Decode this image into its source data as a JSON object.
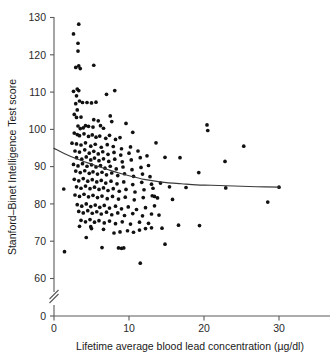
{
  "chart_data": {
    "type": "scatter",
    "title": "",
    "xlabel": "Lifetime average blood lead concentration (µg/dl)",
    "ylabel": "Stanford–Binet Intelligence Test score",
    "xlim": [
      0,
      34
    ],
    "ylim": [
      57,
      131
    ],
    "y_axis_break": {
      "present": true,
      "between": [
        0,
        57
      ],
      "zero_tick": 0
    },
    "grid": false,
    "legend": null,
    "xticks": [
      0,
      10,
      20,
      30
    ],
    "yticks": [
      0,
      60,
      70,
      80,
      90,
      100,
      110,
      120,
      130
    ],
    "marker": {
      "shape": "circle",
      "color": "#111111",
      "size_px": 2.6
    },
    "series": [
      {
        "name": "Children",
        "points": [
          [
            1.3,
            84.0
          ],
          [
            1.4,
            67.2
          ],
          [
            3.3,
            128.2
          ],
          [
            2.6,
            125.6
          ],
          [
            3.2,
            123.1
          ],
          [
            3.2,
            121.0
          ],
          [
            3.3,
            117.0
          ],
          [
            3.5,
            116.3
          ],
          [
            2.9,
            116.6
          ],
          [
            5.3,
            117.2
          ],
          [
            3.1,
            110.8
          ],
          [
            3.3,
            110.4
          ],
          [
            2.6,
            110.2
          ],
          [
            3.0,
            109.0
          ],
          [
            7.0,
            109.4
          ],
          [
            8.1,
            110.4
          ],
          [
            3.4,
            107.6
          ],
          [
            3.8,
            107.2
          ],
          [
            2.9,
            106.9
          ],
          [
            4.4,
            107.2
          ],
          [
            5.0,
            107.1
          ],
          [
            5.6,
            107.3
          ],
          [
            3.1,
            105.2
          ],
          [
            2.7,
            104.0
          ],
          [
            3.0,
            103.2
          ],
          [
            3.6,
            103.3
          ],
          [
            7.5,
            103.6
          ],
          [
            7.7,
            102.1
          ],
          [
            5.3,
            102.6
          ],
          [
            5.9,
            102.3
          ],
          [
            4.2,
            101.0
          ],
          [
            4.6,
            100.8
          ],
          [
            5.2,
            100.6
          ],
          [
            3.2,
            100.9
          ],
          [
            3.5,
            100.2
          ],
          [
            3.9,
            100.4
          ],
          [
            6.2,
            101.0
          ],
          [
            6.6,
            100.3
          ],
          [
            9.6,
            101.6
          ],
          [
            10.5,
            99.2
          ],
          [
            20.4,
            101.2
          ],
          [
            20.5,
            99.7
          ],
          [
            2.7,
            99.0
          ],
          [
            3.1,
            98.6
          ],
          [
            3.4,
            98.3
          ],
          [
            4.0,
            98.8
          ],
          [
            4.6,
            98.1
          ],
          [
            5.1,
            98.5
          ],
          [
            5.6,
            97.9
          ],
          [
            6.1,
            98.2
          ],
          [
            6.9,
            97.6
          ],
          [
            7.4,
            98.4
          ],
          [
            8.2,
            97.3
          ],
          [
            8.8,
            97.8
          ],
          [
            2.4,
            96.3
          ],
          [
            3.0,
            96.1
          ],
          [
            3.6,
            95.8
          ],
          [
            4.2,
            96.4
          ],
          [
            4.9,
            95.5
          ],
          [
            5.5,
            96.0
          ],
          [
            6.3,
            95.2
          ],
          [
            7.1,
            95.9
          ],
          [
            7.9,
            95.4
          ],
          [
            9.0,
            94.8
          ],
          [
            10.2,
            95.3
          ],
          [
            13.6,
            96.4
          ],
          [
            25.3,
            95.5
          ],
          [
            2.8,
            94.2
          ],
          [
            3.4,
            93.9
          ],
          [
            4.1,
            94.5
          ],
          [
            4.7,
            93.6
          ],
          [
            5.3,
            94.1
          ],
          [
            5.9,
            93.4
          ],
          [
            6.5,
            94.0
          ],
          [
            7.2,
            93.3
          ],
          [
            8.0,
            93.8
          ],
          [
            8.9,
            93.1
          ],
          [
            10.0,
            93.6
          ],
          [
            11.2,
            94.2
          ],
          [
            3.0,
            92.4
          ],
          [
            3.7,
            92.0
          ],
          [
            4.3,
            92.6
          ],
          [
            4.9,
            91.8
          ],
          [
            5.4,
            92.3
          ],
          [
            6.0,
            91.6
          ],
          [
            6.6,
            92.1
          ],
          [
            7.3,
            91.4
          ],
          [
            8.1,
            92.0
          ],
          [
            9.1,
            91.3
          ],
          [
            10.3,
            91.8
          ],
          [
            11.5,
            92.4
          ],
          [
            12.4,
            92.9
          ],
          [
            14.8,
            92.5
          ],
          [
            16.8,
            92.4
          ],
          [
            22.8,
            91.4
          ],
          [
            2.6,
            90.6
          ],
          [
            3.2,
            90.2
          ],
          [
            3.8,
            90.8
          ],
          [
            4.4,
            90.1
          ],
          [
            5.0,
            90.5
          ],
          [
            5.6,
            89.9
          ],
          [
            6.2,
            90.3
          ],
          [
            6.8,
            89.6
          ],
          [
            7.5,
            90.1
          ],
          [
            8.3,
            89.4
          ],
          [
            9.2,
            89.9
          ],
          [
            10.4,
            89.2
          ],
          [
            11.6,
            89.8
          ],
          [
            12.6,
            90.3
          ],
          [
            19.3,
            88.4
          ],
          [
            2.9,
            88.8
          ],
          [
            3.5,
            88.4
          ],
          [
            4.1,
            88.9
          ],
          [
            4.7,
            88.2
          ],
          [
            5.2,
            88.6
          ],
          [
            5.8,
            88.0
          ],
          [
            6.4,
            88.5
          ],
          [
            7.0,
            87.8
          ],
          [
            7.7,
            88.3
          ],
          [
            8.5,
            87.6
          ],
          [
            9.4,
            88.1
          ],
          [
            10.6,
            87.4
          ],
          [
            11.8,
            88.0
          ],
          [
            12.8,
            87.3
          ],
          [
            2.7,
            86.6
          ],
          [
            3.3,
            86.2
          ],
          [
            3.9,
            86.8
          ],
          [
            4.5,
            86.1
          ],
          [
            5.1,
            86.5
          ],
          [
            5.7,
            85.9
          ],
          [
            6.3,
            86.3
          ],
          [
            6.9,
            85.6
          ],
          [
            7.6,
            86.1
          ],
          [
            8.4,
            85.4
          ],
          [
            9.3,
            85.9
          ],
          [
            10.5,
            85.2
          ],
          [
            11.7,
            85.8
          ],
          [
            13.0,
            85.3
          ],
          [
            14.2,
            85.6
          ],
          [
            3.0,
            84.6
          ],
          [
            3.6,
            84.2
          ],
          [
            4.2,
            84.8
          ],
          [
            4.8,
            84.1
          ],
          [
            5.4,
            84.5
          ],
          [
            6.0,
            83.9
          ],
          [
            6.6,
            84.3
          ],
          [
            7.2,
            83.6
          ],
          [
            7.9,
            84.1
          ],
          [
            8.7,
            83.4
          ],
          [
            9.6,
            83.9
          ],
          [
            10.8,
            83.2
          ],
          [
            12.0,
            83.8
          ],
          [
            13.2,
            84.2
          ],
          [
            15.4,
            84.6
          ],
          [
            17.6,
            84.4
          ],
          [
            22.9,
            84.3
          ],
          [
            30.0,
            84.5
          ],
          [
            28.5,
            80.5
          ],
          [
            2.8,
            82.4
          ],
          [
            3.4,
            82.0
          ],
          [
            4.0,
            82.6
          ],
          [
            4.6,
            81.9
          ],
          [
            5.2,
            82.3
          ],
          [
            5.8,
            81.7
          ],
          [
            6.4,
            82.1
          ],
          [
            7.1,
            81.4
          ],
          [
            7.8,
            82.0
          ],
          [
            8.6,
            81.3
          ],
          [
            9.5,
            81.8
          ],
          [
            10.7,
            81.1
          ],
          [
            11.9,
            81.7
          ],
          [
            13.1,
            82.2
          ],
          [
            13.4,
            82.0
          ],
          [
            13.8,
            81.6
          ],
          [
            15.8,
            81.2
          ],
          [
            3.1,
            79.8
          ],
          [
            3.7,
            79.4
          ],
          [
            4.3,
            80.0
          ],
          [
            4.9,
            79.3
          ],
          [
            5.5,
            79.7
          ],
          [
            6.1,
            79.1
          ],
          [
            6.7,
            79.6
          ],
          [
            7.4,
            78.9
          ],
          [
            8.2,
            79.4
          ],
          [
            9.0,
            78.7
          ],
          [
            9.9,
            79.2
          ],
          [
            11.0,
            78.5
          ],
          [
            12.2,
            79.0
          ],
          [
            13.4,
            79.5
          ],
          [
            3.3,
            78.0
          ],
          [
            3.9,
            77.6
          ],
          [
            4.5,
            78.2
          ],
          [
            5.1,
            77.5
          ],
          [
            5.7,
            77.9
          ],
          [
            6.3,
            77.3
          ],
          [
            7.0,
            77.8
          ],
          [
            7.7,
            77.1
          ],
          [
            8.5,
            77.6
          ],
          [
            9.4,
            76.9
          ],
          [
            10.5,
            77.4
          ],
          [
            11.8,
            76.8
          ],
          [
            13.0,
            77.3
          ],
          [
            14.0,
            77.0
          ],
          [
            3.6,
            75.6
          ],
          [
            4.2,
            75.2
          ],
          [
            4.8,
            75.8
          ],
          [
            5.4,
            75.1
          ],
          [
            6.0,
            75.5
          ],
          [
            6.7,
            74.9
          ],
          [
            7.4,
            75.4
          ],
          [
            8.2,
            74.7
          ],
          [
            9.1,
            75.2
          ],
          [
            10.2,
            74.6
          ],
          [
            11.4,
            75.1
          ],
          [
            12.6,
            74.8
          ],
          [
            3.4,
            74.0
          ],
          [
            4.9,
            73.9
          ],
          [
            6.6,
            73.2
          ],
          [
            8.0,
            72.2
          ],
          [
            8.8,
            72.5
          ],
          [
            9.8,
            72.8
          ],
          [
            10.6,
            72.4
          ],
          [
            11.4,
            73.0
          ],
          [
            12.2,
            73.4
          ],
          [
            13.0,
            73.6
          ],
          [
            14.4,
            73.5
          ],
          [
            16.6,
            74.3
          ],
          [
            19.4,
            74.2
          ],
          [
            4.3,
            71.0
          ],
          [
            5.0,
            73.4
          ],
          [
            6.4,
            68.3
          ],
          [
            8.6,
            68.2
          ],
          [
            9.0,
            68.1
          ],
          [
            9.3,
            68.2
          ],
          [
            14.8,
            69.2
          ],
          [
            11.5,
            64.1
          ]
        ]
      }
    ],
    "fit_line": {
      "name": "smoothed fit",
      "color": "#3a3a3a",
      "points": [
        [
          0.0,
          94.9
        ],
        [
          1.5,
          93.4
        ],
        [
          3.0,
          92.1
        ],
        [
          4.5,
          91.0
        ],
        [
          6.0,
          90.0
        ],
        [
          7.5,
          89.0
        ],
        [
          9.0,
          88.1
        ],
        [
          10.5,
          87.3
        ],
        [
          12.0,
          86.6
        ],
        [
          13.5,
          86.1
        ],
        [
          15.0,
          85.7
        ],
        [
          17.0,
          85.4
        ],
        [
          19.0,
          85.1
        ],
        [
          21.0,
          85.0
        ],
        [
          24.0,
          84.8
        ],
        [
          27.0,
          84.6
        ],
        [
          30.0,
          84.5
        ]
      ]
    }
  },
  "axes": {
    "y_title": "Stanford–Binet Intelligence Test score",
    "x_title": "Lifetime average blood lead concentration (µg/dl)",
    "y_tick_labels": [
      "130",
      "120",
      "110",
      "100",
      "90",
      "80",
      "70",
      "60",
      "0"
    ],
    "x_tick_labels": [
      "0",
      "10",
      "20",
      "30"
    ]
  }
}
